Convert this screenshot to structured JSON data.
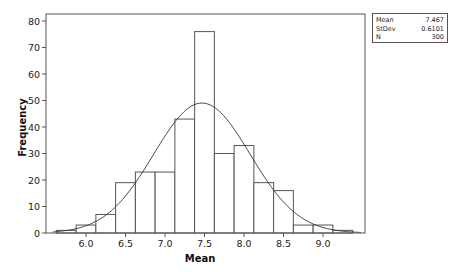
{
  "chart_data": {
    "type": "bar",
    "subtype": "histogram_with_normal_fit",
    "title": "",
    "xlabel": "Mean",
    "ylabel": "Frequency",
    "bin_width": 0.25,
    "bin_centers": [
      5.75,
      6.0,
      6.25,
      6.5,
      6.75,
      7.0,
      7.25,
      7.5,
      7.75,
      8.0,
      8.25,
      8.5,
      8.75,
      9.0,
      9.25
    ],
    "categories": [
      "5.75",
      "6.0",
      "6.25",
      "6.5",
      "6.75",
      "7.0",
      "7.25",
      "7.5",
      "7.75",
      "8.0",
      "8.25",
      "8.5",
      "8.75",
      "9.0",
      "9.25"
    ],
    "values": [
      1,
      3,
      7,
      19,
      23,
      23,
      43,
      76,
      30,
      33,
      19,
      16,
      3,
      3,
      1
    ],
    "xticks": [
      "6.0",
      "6.5",
      "7.0",
      "7.5",
      "8.0",
      "8.5",
      "9.0"
    ],
    "yticks": [
      "0",
      "10",
      "20",
      "30",
      "40",
      "50",
      "60",
      "70",
      "80"
    ],
    "xlim": [
      5.55,
      9.55
    ],
    "ylim": [
      0,
      82
    ],
    "grid": false,
    "normal_fit": {
      "mean": 7.467,
      "stdev": 0.6101,
      "n": 300,
      "peak_frequency": 49
    },
    "legend": {
      "position": "top-right-outside",
      "entries": []
    },
    "colors": {
      "bar_fill": "#ffffff",
      "bar_edge": "#555555",
      "curve": "#333333",
      "frame": "#555555"
    }
  },
  "stats_box": {
    "rows": [
      {
        "label": "Mean",
        "value": "7.467"
      },
      {
        "label": "StDev",
        "value": "0.6101"
      },
      {
        "label": "N",
        "value": "300"
      }
    ]
  },
  "axes": {
    "xlabel": "Mean",
    "ylabel": "Frequency"
  }
}
